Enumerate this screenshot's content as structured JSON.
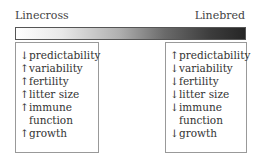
{
  "scale": {
    "left_label": "Linecross",
    "right_label": "Linebred",
    "gradient_colors": [
      "#ffffff",
      "#262626"
    ]
  },
  "linecross": {
    "items": [
      {
        "arrow": "↓",
        "text": "predictability"
      },
      {
        "arrow": "↑",
        "text": "variability"
      },
      {
        "arrow": "↑",
        "text": "fertility"
      },
      {
        "arrow": "↑",
        "text": "litter size"
      },
      {
        "arrow": "↑",
        "text": "immune"
      },
      {
        "arrow": "",
        "text": "function"
      },
      {
        "arrow": "↑",
        "text": "growth"
      }
    ]
  },
  "linebred": {
    "items": [
      {
        "arrow": "↑",
        "text": "predictability"
      },
      {
        "arrow": "↓",
        "text": "variability"
      },
      {
        "arrow": "↓",
        "text": "fertility"
      },
      {
        "arrow": "↓",
        "text": "litter size"
      },
      {
        "arrow": "↓",
        "text": "immune"
      },
      {
        "arrow": "",
        "text": "function"
      },
      {
        "arrow": "↓",
        "text": "growth"
      }
    ]
  }
}
